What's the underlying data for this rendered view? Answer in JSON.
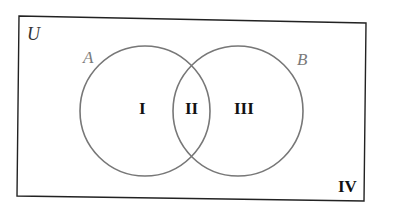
{
  "diagram": {
    "type": "venn",
    "universe_label": "U",
    "sets": [
      {
        "label": "A",
        "color": "#777777"
      },
      {
        "label": "B",
        "color": "#777777"
      }
    ],
    "regions": [
      {
        "id": "I",
        "label": "I",
        "description": "A only"
      },
      {
        "id": "II",
        "label": "II",
        "description": "A and B"
      },
      {
        "id": "III",
        "label": "III",
        "description": "B only"
      },
      {
        "id": "IV",
        "label": "IV",
        "description": "neither A nor B"
      }
    ],
    "border_color": "#222222"
  }
}
